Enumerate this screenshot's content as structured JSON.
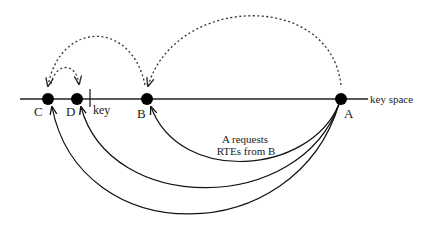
{
  "diagram": {
    "axis_label": "key space",
    "key_label": "key",
    "nodes": [
      {
        "id": "C",
        "label": "C"
      },
      {
        "id": "D",
        "label": "D"
      },
      {
        "id": "B",
        "label": "B"
      },
      {
        "id": "A",
        "label": "A"
      }
    ],
    "dashed_arrows": [
      {
        "from": "A",
        "to": "B"
      },
      {
        "from": "B",
        "to": "C"
      },
      {
        "from": "C",
        "to": "D"
      }
    ],
    "solid_arrows": [
      {
        "from": "A",
        "to": "B"
      },
      {
        "from": "A",
        "to": "D"
      },
      {
        "from": "A",
        "to": "C"
      }
    ],
    "annotation_line1": "A requests",
    "annotation_line2": "RTEs from B",
    "colors": {
      "ink": "#111111",
      "dashed": "#333333"
    }
  }
}
